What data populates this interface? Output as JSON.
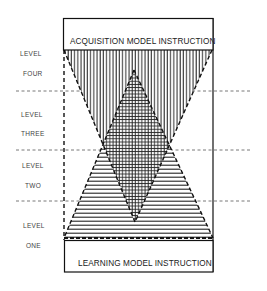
{
  "diagram": {
    "top_box": {
      "label": "ACQUISITION MODEL INSTRUCTION"
    },
    "bottom_box": {
      "label": "LEARNING MODEL INSTRUCTION"
    },
    "levels": [
      {
        "word": "LEVEL",
        "number": "FOUR"
      },
      {
        "word": "LEVEL",
        "number": "THREE"
      },
      {
        "word": "LEVEL",
        "number": "TWO"
      },
      {
        "word": "LEVEL",
        "number": "ONE"
      }
    ],
    "shapes": {
      "inverted_triangle": {
        "fill": "vertical-lines",
        "meaning": "acquisition"
      },
      "upright_triangle": {
        "fill": "horizontal-lines",
        "meaning": "learning"
      },
      "overlap": {
        "fill": "crosshatch"
      }
    },
    "colors": {
      "ink": "#1a1a1a",
      "background": "#ffffff",
      "label": "#444444"
    }
  }
}
